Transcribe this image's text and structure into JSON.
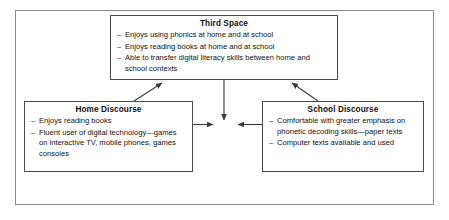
{
  "diagram": {
    "title_semantic": "third-space-discourse-model",
    "frame": {
      "label": "outer-frame"
    },
    "nodes": [
      {
        "id": "third-space",
        "title": "Third Space",
        "bullets": [
          "Enjoys using phonics at home and at school",
          "Enjoys reading books at home and at school",
          "Able to transfer digital literacy skills between home and school contexts"
        ]
      },
      {
        "id": "home-discourse",
        "title": "Home Discourse",
        "bullets": [
          "Enjoys reading books",
          "Fluent user of digital technology—games on interactive TV, mobile phones, games consoles"
        ]
      },
      {
        "id": "school-discourse",
        "title": "School Discourse",
        "bullets": [
          "Comfortable with greater emphasis on phonetic decoding skills—paper texts",
          "Computer texts available and used"
        ]
      }
    ],
    "bullet_marker": "–",
    "connectors": [
      {
        "id": "home-to-third-space",
        "from": "home-discourse",
        "to": "third-space",
        "direction": "up-right"
      },
      {
        "id": "school-to-third-space",
        "from": "school-discourse",
        "to": "third-space",
        "direction": "up-left"
      },
      {
        "id": "third-space-to-center",
        "from": "third-space",
        "to": "center-junction",
        "direction": "down"
      },
      {
        "id": "home-to-center",
        "from": "home-discourse",
        "to": "center-junction",
        "direction": "right"
      },
      {
        "id": "school-to-center",
        "from": "school-discourse",
        "to": "center-junction",
        "direction": "left"
      }
    ],
    "colors": {
      "frame_border": "#8a8a8a",
      "box_border": "#4a4a4a",
      "text": "#111111",
      "connector": "#3a3a3a",
      "background": "#ffffff"
    }
  }
}
